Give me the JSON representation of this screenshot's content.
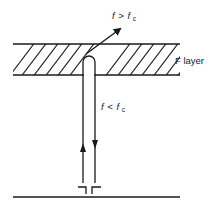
{
  "diagram": {
    "type": "ionospheric-reflection",
    "labels": {
      "layer": "F layer",
      "above_critical": {
        "var": "f",
        "op": ">",
        "sub_var": "f",
        "sub": "c"
      },
      "below_critical": {
        "var": "f",
        "op": "<",
        "sub_var": "f",
        "sub": "c"
      }
    },
    "elements": [
      "ionospheric layer band (hatched)",
      "escaping ray",
      "reflected ray pair",
      "antenna",
      "ground line"
    ],
    "colors": {
      "ink": "#1a1a1a",
      "background": "#ffffff"
    }
  }
}
